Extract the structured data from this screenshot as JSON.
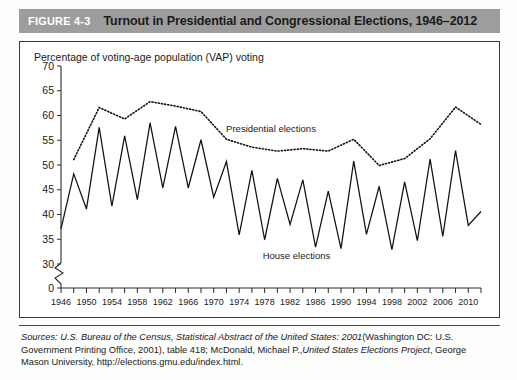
{
  "figure": {
    "number": "FIGURE 4-3",
    "title": "Turnout in Presidential and Congressional Elections, 1946–2012",
    "header_bg": "#9d9d9d",
    "number_color": "#ffffff",
    "title_color": "#1b1b1b"
  },
  "source": {
    "lead": "Sources:",
    "part1_italic": "U.S. Bureau of the Census, Statistical Abstract of the United States: 2001",
    "part2": "(Washington DC: U.S. Government Printing Office, 2001), table 418;  McDonald, Michael P.,",
    "part3_italic": "United States Elections Project",
    "part4": ", George Mason University, http://elections.gmu.edu/index.html."
  },
  "chart_data": {
    "type": "line",
    "title": "Turnout in Presidential and Congressional Elections, 1946–2012",
    "ylabel": "Percentage of voting-age population (VAP) voting",
    "xlabel": "",
    "ylim": [
      0,
      70
    ],
    "y_break_after": 0,
    "y_axis_start": 30,
    "yticks": [
      0,
      30,
      35,
      40,
      45,
      50,
      55,
      60,
      65,
      70
    ],
    "xlim": [
      1946,
      2012
    ],
    "xtick_labels": [
      1946,
      1950,
      1954,
      1958,
      1962,
      1966,
      1970,
      1974,
      1978,
      1982,
      1986,
      1990,
      1994,
      1998,
      2002,
      2006,
      2010
    ],
    "xtick_minor_step": 2,
    "grid": false,
    "legend_position": "inline-annotation",
    "annotations": [
      {
        "text": "Presidential elections",
        "x": 1979,
        "y": 56.6
      },
      {
        "text": "House elections",
        "x": 1983,
        "y": 31.0
      }
    ],
    "series": [
      {
        "name": "House elections",
        "style": "solid",
        "x": [
          1946,
          1948,
          1950,
          1952,
          1954,
          1956,
          1958,
          1960,
          1962,
          1964,
          1966,
          1968,
          1970,
          1972,
          1974,
          1976,
          1978,
          1980,
          1982,
          1984,
          1986,
          1988,
          1990,
          1992,
          1994,
          1996,
          1998,
          2000,
          2002,
          2004,
          2006,
          2008,
          2010,
          2012
        ],
        "values": [
          37.1,
          48.2,
          41.1,
          57.6,
          41.7,
          55.9,
          43.0,
          58.5,
          45.4,
          57.8,
          45.4,
          55.1,
          43.5,
          50.7,
          35.9,
          48.9,
          34.9,
          47.3,
          38.0,
          47.0,
          33.4,
          44.7,
          33.1,
          50.8,
          36.0,
          45.7,
          32.9,
          46.6,
          34.7,
          51.2,
          35.6,
          52.9,
          37.8,
          40.6
        ]
      },
      {
        "name": "Presidential elections",
        "style": "dotted",
        "x": [
          1948,
          1952,
          1956,
          1960,
          1964,
          1968,
          1972,
          1976,
          1980,
          1984,
          1988,
          1992,
          1996,
          2000,
          2004,
          2008,
          2012
        ],
        "values": [
          51.1,
          61.6,
          59.3,
          62.8,
          61.9,
          60.8,
          55.2,
          53.6,
          52.8,
          53.3,
          52.8,
          55.2,
          49.9,
          51.3,
          55.3,
          61.7,
          58.2
        ]
      }
    ]
  }
}
